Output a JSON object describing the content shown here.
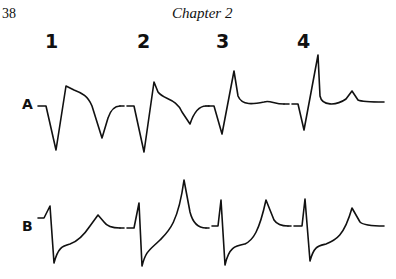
{
  "page": {
    "number": "38",
    "running_head": "Chapter 2"
  },
  "figure": {
    "columns": [
      {
        "label": "1",
        "x": 45
      },
      {
        "label": "2",
        "x": 137
      },
      {
        "label": "3",
        "x": 216
      },
      {
        "label": "4",
        "x": 297
      }
    ],
    "rows": [
      {
        "label": "A",
        "x": 22,
        "y": 96
      },
      {
        "label": "B",
        "x": 22,
        "y": 218
      }
    ],
    "traces": {
      "A1": "M38,106 L46,106 L56,150 L66,86 L74,90 C82,93 88,96 92,106 L102,138 L108,118 Q112,106 120,106",
      "A2": "M127,106 L134,106 L144,152 L154,82 L158,92 C164,100 176,98 182,112 L190,124 Q196,106 206,106",
      "A3": "M208,106 L214,106 L222,134 L234,71 L238,96 C242,106 254,104 264,102 C270,100 274,104 284,104",
      "A4": "M292,104 L298,104 L304,130 L318,55 L320,96 C322,106 336,106 346,99 L352,91 L358,100 Q362,102 384,102",
      "B1": "M38,218 L44,218 L50,206 L54,263 C58,248 62,246 70,244 C76,242 82,238 90,226 L98,215 L104,222 Q108,228 120,228",
      "B2": "M127,228 L134,228 L139,203 L142,266 C146,250 150,250 160,240 C168,232 178,224 184,180 L190,212 Q194,228 206,228",
      "B3": "M212,226 L218,226 L221,200 L225,265 C229,247 235,246 245,244 C253,240 259,232 266,200 L274,220 Q278,226 288,226",
      "B4": "M294,226 L302,226 L305,199 L310,261 C314,246 318,246 326,244 C336,240 344,236 352,208 L360,222 Q364,226 384,226"
    },
    "dashes": [
      "M120,106 L124,106",
      "M206,106 L209,106",
      "M284,104 L289,104",
      "M120,228 L124,228",
      "M206,228 L209,228",
      "M288,226 L291,226"
    ]
  }
}
